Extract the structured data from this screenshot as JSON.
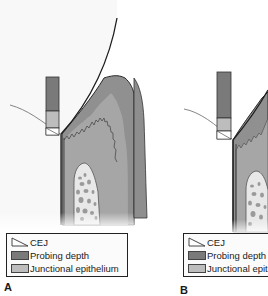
{
  "figure": {
    "panels": [
      {
        "label": "A",
        "legend": [
          {
            "icon": "cej-triangle-icon",
            "text": "CEJ"
          },
          {
            "icon": "probing-depth-swatch",
            "text": "Probing depth"
          },
          {
            "icon": "junctional-epithelium-swatch",
            "text": "Junctional epithelium"
          }
        ]
      },
      {
        "label": "B",
        "legend": [
          {
            "icon": "cej-triangle-icon",
            "text": "CEJ"
          },
          {
            "icon": "probing-depth-swatch",
            "text": "Probing depth"
          },
          {
            "icon": "junctional-epithelium-swatch",
            "text": "Junctional epit"
          }
        ]
      }
    ],
    "colors": {
      "probing_depth": "#7a7a7a",
      "junctional_epithelium": "#bdbdbd",
      "gingiva": "#8c8c8c",
      "gingiva_inner": "#a8a8a8",
      "bone": "#e6e6e6",
      "bone_spots": "#9a9a9a",
      "tooth": "#f7f7f7"
    }
  }
}
